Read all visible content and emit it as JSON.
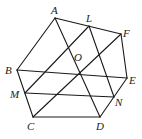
{
  "figure": {
    "type": "geometry",
    "points": [
      {
        "name": "A",
        "label": "A"
      },
      {
        "name": "L",
        "label": "L"
      },
      {
        "name": "F",
        "label": "F"
      },
      {
        "name": "O",
        "label": "O"
      },
      {
        "name": "E",
        "label": "E"
      },
      {
        "name": "B",
        "label": "B"
      },
      {
        "name": "M",
        "label": "M"
      },
      {
        "name": "N",
        "label": "N"
      },
      {
        "name": "C",
        "label": "C"
      },
      {
        "name": "D",
        "label": "D"
      }
    ],
    "segments": [
      [
        "A",
        "F"
      ],
      [
        "F",
        "E"
      ],
      [
        "E",
        "D"
      ],
      [
        "D",
        "C"
      ],
      [
        "C",
        "B"
      ],
      [
        "B",
        "A"
      ],
      [
        "A",
        "D"
      ],
      [
        "B",
        "E"
      ],
      [
        "C",
        "F"
      ],
      [
        "L",
        "M"
      ],
      [
        "L",
        "N"
      ],
      [
        "M",
        "N"
      ]
    ]
  }
}
